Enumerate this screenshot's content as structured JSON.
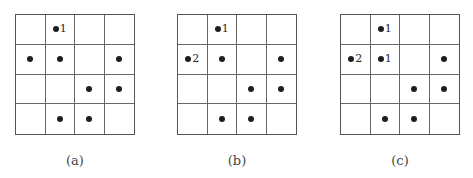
{
  "figure": {
    "panels": [
      {
        "caption": "(a)",
        "rows": 4,
        "cols": 4,
        "dots": [
          {
            "row": 0,
            "col": 1,
            "label": "1"
          },
          {
            "row": 1,
            "col": 0,
            "label": ""
          },
          {
            "row": 1,
            "col": 1,
            "label": ""
          },
          {
            "row": 1,
            "col": 3,
            "label": ""
          },
          {
            "row": 2,
            "col": 2,
            "label": ""
          },
          {
            "row": 2,
            "col": 3,
            "label": ""
          },
          {
            "row": 3,
            "col": 1,
            "label": ""
          },
          {
            "row": 3,
            "col": 2,
            "label": ""
          }
        ]
      },
      {
        "caption": "(b)",
        "rows": 4,
        "cols": 4,
        "dots": [
          {
            "row": 0,
            "col": 1,
            "label": "1"
          },
          {
            "row": 1,
            "col": 0,
            "label": "2"
          },
          {
            "row": 1,
            "col": 1,
            "label": ""
          },
          {
            "row": 1,
            "col": 3,
            "label": ""
          },
          {
            "row": 2,
            "col": 2,
            "label": ""
          },
          {
            "row": 2,
            "col": 3,
            "label": ""
          },
          {
            "row": 3,
            "col": 1,
            "label": ""
          },
          {
            "row": 3,
            "col": 2,
            "label": ""
          }
        ]
      },
      {
        "caption": "(c)",
        "rows": 4,
        "cols": 4,
        "dots": [
          {
            "row": 0,
            "col": 1,
            "label": "1"
          },
          {
            "row": 1,
            "col": 0,
            "label": "2"
          },
          {
            "row": 1,
            "col": 1,
            "label": "1"
          },
          {
            "row": 1,
            "col": 3,
            "label": ""
          },
          {
            "row": 2,
            "col": 2,
            "label": ""
          },
          {
            "row": 2,
            "col": 3,
            "label": ""
          },
          {
            "row": 3,
            "col": 1,
            "label": ""
          },
          {
            "row": 3,
            "col": 2,
            "label": ""
          }
        ]
      }
    ]
  },
  "layout": {
    "panel_offsets": [
      15,
      177,
      340
    ],
    "dot_color": "#1e1e1e",
    "grid_line_color": "#666666"
  }
}
